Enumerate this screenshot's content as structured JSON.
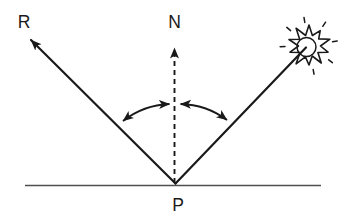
{
  "diagram": {
    "labels": {
      "reflected_ray": "R",
      "normal": "N",
      "point_of_incidence": "P"
    },
    "icons": {
      "light_source": "sun-burst-icon"
    },
    "colors": {
      "ink": "#1a1a1a",
      "surface_line": "#4f4f4f",
      "background": "#ffffff"
    }
  }
}
